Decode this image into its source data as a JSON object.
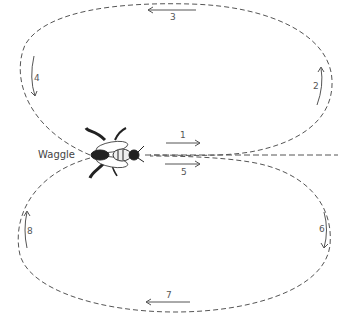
{
  "diagram": {
    "waggle_label": "Waggle",
    "steps": [
      {
        "n": "1",
        "direction": "right",
        "phase": "waggle run (first)"
      },
      {
        "n": "2",
        "direction": "up",
        "phase": "return loop right"
      },
      {
        "n": "3",
        "direction": "left",
        "phase": "return loop top"
      },
      {
        "n": "4",
        "direction": "down",
        "phase": "return loop left"
      },
      {
        "n": "5",
        "direction": "right",
        "phase": "waggle run (second)"
      },
      {
        "n": "6",
        "direction": "down",
        "phase": "return loop right"
      },
      {
        "n": "7",
        "direction": "left",
        "phase": "return loop bottom"
      },
      {
        "n": "8",
        "direction": "up",
        "phase": "return loop left"
      }
    ],
    "colors": {
      "line": "#444444",
      "text": "#555555",
      "bee": "#222222"
    }
  }
}
